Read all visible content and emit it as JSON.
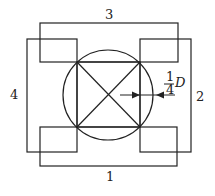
{
  "diagram": {
    "labels": {
      "side_1": "1",
      "side_2": "2",
      "side_3": "3",
      "side_4": "4"
    },
    "dimension": {
      "numerator": "1",
      "denominator": "4",
      "variable": "D"
    },
    "colors": {
      "stroke": "#222222",
      "background": "#ffffff"
    }
  }
}
